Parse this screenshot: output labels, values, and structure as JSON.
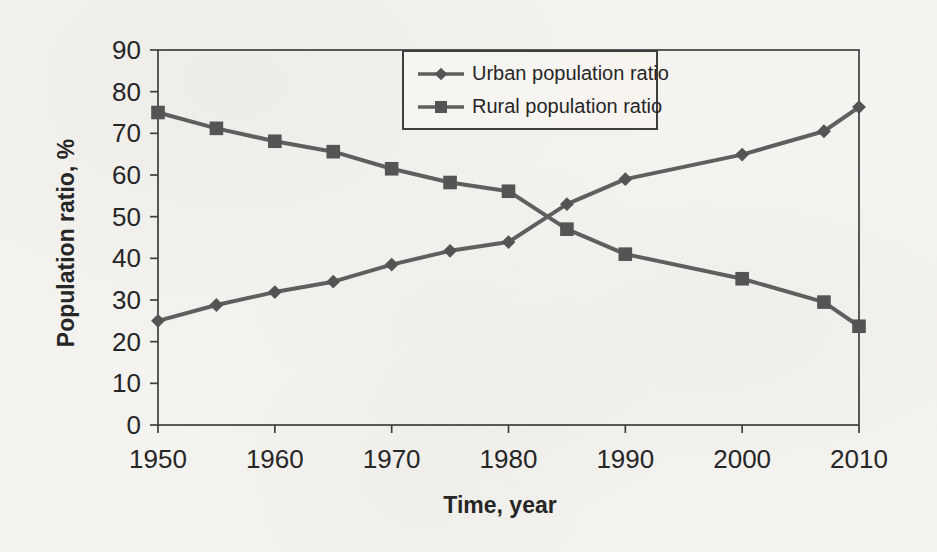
{
  "chart_data": {
    "type": "line",
    "title": "",
    "xlabel": "Time, year",
    "ylabel": "Population ratio, %",
    "x": [
      1950,
      1955,
      1960,
      1965,
      1970,
      1975,
      1980,
      1985,
      1990,
      2000,
      2007,
      2010
    ],
    "series": [
      {
        "name": "Urban population ratio",
        "marker": "diamond",
        "values": [
          25.0,
          28.8,
          31.9,
          34.4,
          38.5,
          41.8,
          43.9,
          53.0,
          59.0,
          64.9,
          70.5,
          76.3
        ]
      },
      {
        "name": "Rural population ratio",
        "marker": "square",
        "values": [
          75.0,
          71.2,
          68.1,
          65.6,
          61.5,
          58.2,
          56.1,
          47.0,
          41.0,
          35.1,
          29.5,
          23.7
        ]
      }
    ],
    "xlim": [
      1950,
      2010
    ],
    "ylim": [
      0,
      90
    ],
    "x_ticks": [
      1950,
      1960,
      1970,
      1980,
      1990,
      2000,
      2010
    ],
    "y_ticks": [
      0,
      10,
      20,
      30,
      40,
      50,
      60,
      70,
      80,
      90
    ],
    "grid": false,
    "legend_position": "inside-top-center",
    "colors": {
      "line": "#5f5f5f",
      "marker": "#545454",
      "axis": "#3e3e3e",
      "text": "#262626",
      "background": "#f5f3ef"
    }
  }
}
